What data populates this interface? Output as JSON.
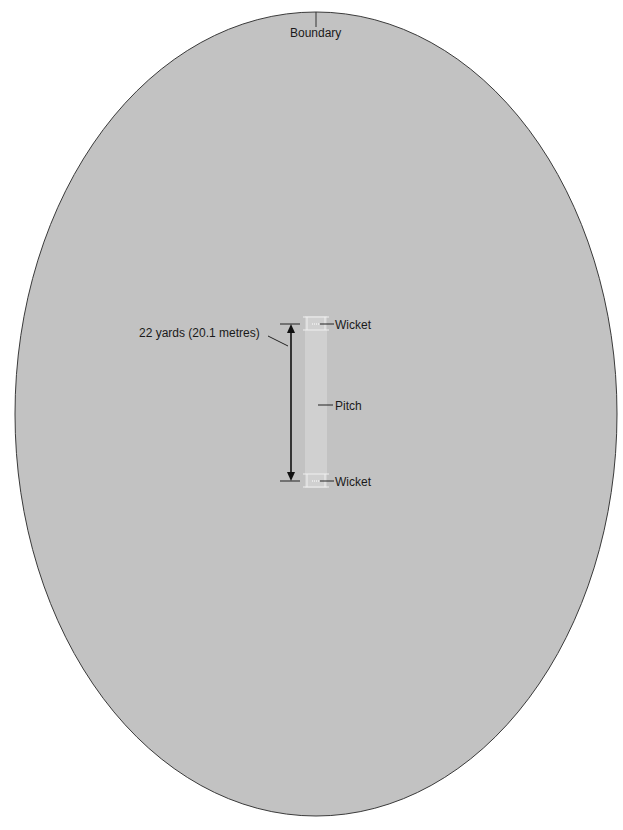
{
  "diagram": {
    "type": "cricket-field-layout",
    "colors": {
      "field": "#c2c2c2",
      "boundary_line": "#3a3a3a",
      "pitch": "#d2d2d2",
      "crease_lines": "#f2f2f2",
      "text": "#1a1a1a"
    },
    "labels": {
      "boundary": "Boundary",
      "measurement": "22 yards (20.1 metres)",
      "wicket_top": "Wicket",
      "pitch": "Pitch",
      "wicket_bottom": "Wicket"
    }
  }
}
